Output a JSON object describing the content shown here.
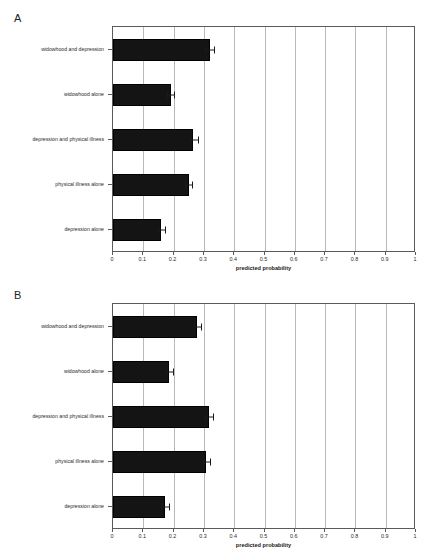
{
  "figure": {
    "background": "#ffffff",
    "bar_color": "#141414",
    "grid_color": "#b9b9b9",
    "axis_color": "#5a5a5a"
  },
  "chart_data": [
    {
      "type": "bar",
      "orientation": "horizontal",
      "panel_label": "A",
      "title": "",
      "xlabel": "predicted probability",
      "ylabel": "",
      "xlim": [
        0,
        1
      ],
      "xticks": [
        0,
        0.1,
        0.2,
        0.3,
        0.4,
        0.5,
        0.6,
        0.7,
        0.8,
        0.9,
        1
      ],
      "xticklabels": [
        "0",
        "0.1",
        "0.2",
        "0.3",
        "0.4",
        "0.5",
        "0.6",
        "0.7",
        "0.8",
        "0.9",
        "1"
      ],
      "grid": true,
      "legend": "none",
      "categories": [
        "widowhood and depression",
        "widowhood alone",
        "depression and physical illness",
        "physical illness alone",
        "depression alone"
      ],
      "values": [
        0.32,
        0.19,
        0.265,
        0.25,
        0.16
      ],
      "errors_low": [
        0.305,
        0.178,
        0.253,
        0.238,
        0.15
      ],
      "errors_high": [
        0.334,
        0.202,
        0.28,
        0.262,
        0.172
      ]
    },
    {
      "type": "bar",
      "orientation": "horizontal",
      "panel_label": "B",
      "title": "",
      "xlabel": "predicted probability",
      "ylabel": "",
      "xlim": [
        0,
        1
      ],
      "xticks": [
        0,
        0.1,
        0.2,
        0.3,
        0.4,
        0.5,
        0.6,
        0.7,
        0.8,
        0.9,
        1
      ],
      "xticklabels": [
        "0",
        "0.1",
        "0.2",
        "0.3",
        "0.4",
        "0.5",
        "0.6",
        "0.7",
        "0.8",
        "0.9",
        "1"
      ],
      "grid": true,
      "legend": "none",
      "categories": [
        "widowhood and depression",
        "widowhood alone",
        "depression and physical illness",
        "physical illness alone",
        "depression alone"
      ],
      "values": [
        0.278,
        0.185,
        0.317,
        0.307,
        0.172
      ],
      "errors_low": [
        0.266,
        0.174,
        0.305,
        0.296,
        0.16
      ],
      "errors_high": [
        0.292,
        0.198,
        0.33,
        0.319,
        0.186
      ]
    }
  ]
}
